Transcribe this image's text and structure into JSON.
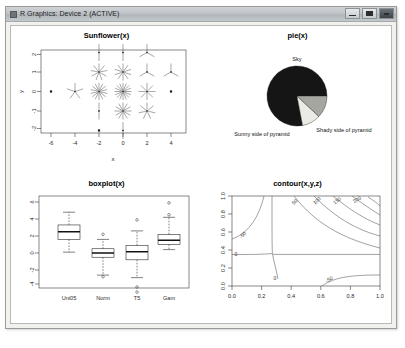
{
  "window": {
    "title": "R Graphics: Device 2 (ACTIVE)",
    "icon": "r-graphics-icon",
    "buttons": {
      "minimize": "minimize-icon",
      "maximize": "maximize-icon",
      "close": "close-icon"
    }
  },
  "chart_data": [
    {
      "type": "scatter",
      "id": "sunflower",
      "title": "Sunflower(x)",
      "xlabel": "x",
      "ylabel": "y",
      "xticks": [
        "-6",
        "-4",
        "-2",
        "0",
        "2",
        "4"
      ],
      "yticks": [
        "2",
        "1",
        "0",
        "-1",
        "-2"
      ],
      "xlim": [
        -7,
        5
      ],
      "ylim": [
        -2.6,
        2.4
      ],
      "grid": false,
      "note": "sunflower plot: petal count encodes multiplicity at each (x,y) grid point",
      "points": [
        {
          "x": -6,
          "y": 0,
          "petals": 1
        },
        {
          "x": -4,
          "y": 0,
          "petals": 5
        },
        {
          "x": -2,
          "y": -2,
          "petals": 1
        },
        {
          "x": -2,
          "y": -1,
          "petals": 2
        },
        {
          "x": -2,
          "y": 0,
          "petals": 14
        },
        {
          "x": -2,
          "y": 1,
          "petals": 9
        },
        {
          "x": -2,
          "y": 2,
          "petals": 2
        },
        {
          "x": 0,
          "y": -2,
          "petals": 2
        },
        {
          "x": 0,
          "y": -1,
          "petals": 12
        },
        {
          "x": 0,
          "y": 0,
          "petals": 16
        },
        {
          "x": 0,
          "y": 1,
          "petals": 10
        },
        {
          "x": 0,
          "y": 2,
          "petals": 2
        },
        {
          "x": 2,
          "y": -1,
          "petals": 7
        },
        {
          "x": 2,
          "y": 0,
          "petals": 8
        },
        {
          "x": 2,
          "y": 1,
          "petals": 3
        },
        {
          "x": 2,
          "y": 2,
          "petals": 3
        },
        {
          "x": 4,
          "y": 0,
          "petals": 1
        },
        {
          "x": 4,
          "y": 1,
          "petals": 3
        }
      ]
    },
    {
      "type": "pie",
      "id": "pie",
      "title": "pie(x)",
      "labels": [
        "Sky",
        "Sunny side of pyramid",
        "Shady side of pyramid"
      ],
      "values": [
        78,
        10,
        12
      ],
      "colors": [
        "#151515",
        "#ebebe6",
        "#a6a6a1"
      ]
    },
    {
      "type": "box",
      "id": "boxplot",
      "title": "boxplot(x)",
      "categories": [
        "Uni05",
        "Norm",
        "T5",
        "Gam"
      ],
      "yticks": [
        "6",
        "4",
        "2",
        "0",
        "-2",
        "-4"
      ],
      "ylim": [
        -5,
        7
      ],
      "boxes": [
        {
          "name": "Uni05",
          "min": 0.1,
          "q1": 1.6,
          "median": 2.5,
          "q3": 3.3,
          "max": 4.8,
          "outliers": []
        },
        {
          "name": "Norm",
          "min": -2.6,
          "q1": -0.5,
          "median": 0.0,
          "q3": 0.5,
          "max": 1.6,
          "outliers": [
            2.2,
            -2.8
          ]
        },
        {
          "name": "T5",
          "min": -2.9,
          "q1": -0.8,
          "median": 0.15,
          "q3": 0.9,
          "max": 2.6,
          "outliers": [
            3.9,
            -4.0,
            -4.6
          ]
        },
        {
          "name": "Gam",
          "min": 0.4,
          "q1": 1.0,
          "median": 1.5,
          "q3": 2.2,
          "max": 4.2,
          "outliers": [
            5.9,
            4.5
          ]
        }
      ]
    },
    {
      "type": "contour",
      "id": "contour",
      "title": "contour(x,y,z)",
      "xlabel": "",
      "ylabel": "",
      "xticks": [
        "0.0",
        "0.2",
        "0.4",
        "0.6",
        "0.8",
        "1.0"
      ],
      "yticks": [
        "0.0",
        "0.2",
        "0.4",
        "0.6",
        "0.8",
        "1.0"
      ],
      "xlim": [
        0,
        1
      ],
      "ylim": [
        0,
        1
      ],
      "levels": [
        "-50",
        "0",
        "50",
        "100",
        "150",
        "200",
        "-50"
      ]
    }
  ]
}
